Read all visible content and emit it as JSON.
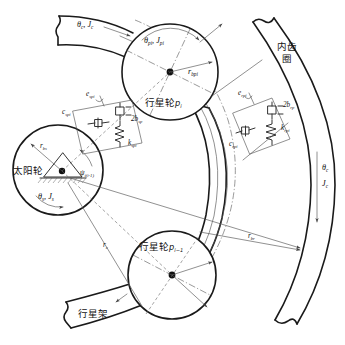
{
  "figure": {
    "type": "mechanical-schematic",
    "background_color": "#ffffff",
    "line_color": "#1a1a1a"
  },
  "components": {
    "sun_gear": {
      "label": "太阳轮",
      "rotation_inertia_label": "θ",
      "rotation_inertia_sub": "s",
      "inertia_label": "J",
      "inertia_sub": "s",
      "radius_label": "r",
      "radius_sub": "bs",
      "angle_label": "ψ",
      "angle_sub": "i(i-1)"
    },
    "planet_gear_i": {
      "label": "行星轮",
      "index": "p",
      "index_sub": "i",
      "rotation_label": "θ",
      "rotation_sub": "pi",
      "inertia_label": "J",
      "inertia_sub": "pi",
      "radius_label": "r",
      "radius_sub": "bpi"
    },
    "planet_gear_i_minus_1": {
      "label": "行星轮",
      "index": "p",
      "index_sub": "i−1"
    },
    "ring_gear": {
      "label_line1": "内齿",
      "label_line2": "圈",
      "radius_label": "r",
      "radius_sub": "br"
    },
    "carrier": {
      "label": "行星架",
      "rotation_label": "θ",
      "rotation_sub": "c",
      "inertia_label": "J",
      "inertia_sub": "c",
      "radius_label": "r",
      "radius_sub": "c",
      "top_rotation_label": "θ",
      "top_rotation_sub": "c",
      "top_inertia_label": "J",
      "top_inertia_sub": "c"
    }
  },
  "mesh_sun_planet": {
    "error_label": "e",
    "error_sub": "spi",
    "damping_label": "c",
    "damping_sub": "spi",
    "stiffness_label": "k",
    "stiffness_sub": "spi",
    "backlash_label": "2b",
    "backlash_sub": "sp"
  },
  "mesh_ring_planet": {
    "error_label": "e",
    "error_sub": "rpi",
    "damping_label": "c",
    "damping_sub": "rpi",
    "stiffness_label": "k",
    "stiffness_sub": "rpi",
    "backlash_label": "2b",
    "backlash_sub": "rp"
  }
}
